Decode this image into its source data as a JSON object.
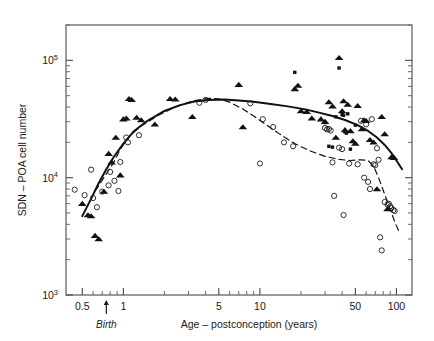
{
  "figure": {
    "name": "sdn-poa-cell-number-vs-age-scatter"
  },
  "chart_data": {
    "type": "scatter",
    "title": "",
    "xlabel": "Age – postconception (years)",
    "ylabel": "SDN – POA cell number",
    "xscale": "log",
    "yscale": "log",
    "xlim": [
      0.38,
      130
    ],
    "ylim": [
      1000,
      200000
    ],
    "grid": false,
    "legend": "none",
    "x_ticks": [
      {
        "value": 0.5,
        "label": "0.5"
      },
      {
        "value": 1,
        "label": "1"
      },
      {
        "value": 5,
        "label": "5"
      },
      {
        "value": 10,
        "label": "10"
      },
      {
        "value": 50,
        "label": "50"
      },
      {
        "value": 100,
        "label": "100"
      }
    ],
    "x_minor_ticks": [
      0.6,
      0.7,
      0.8,
      0.9,
      2,
      3,
      4,
      6,
      7,
      8,
      9,
      20,
      30,
      40,
      60,
      70,
      80,
      90
    ],
    "y_ticks": [
      {
        "value": 100000,
        "base": "10",
        "exp": "5"
      },
      {
        "value": 10000,
        "base": "10",
        "exp": "4"
      },
      {
        "value": 1000,
        "base": "10",
        "exp": "3"
      }
    ],
    "y_minor_ticks": [
      2000,
      3000,
      4000,
      5000,
      6000,
      7000,
      8000,
      9000,
      20000,
      30000,
      40000,
      50000,
      60000,
      70000,
      80000,
      90000,
      200000
    ],
    "annotations": [
      {
        "name": "birth-marker",
        "text": "Birth",
        "x": 0.75,
        "style": "italic",
        "arrow": "up"
      }
    ],
    "series": [
      {
        "name": "open-circles",
        "marker": "open-circle",
        "color": "#1a1a1a",
        "points": [
          [
            0.44,
            7900
          ],
          [
            0.52,
            7100
          ],
          [
            0.58,
            11700
          ],
          [
            0.6,
            6700
          ],
          [
            0.64,
            5600
          ],
          [
            0.7,
            7600
          ],
          [
            0.78,
            8600
          ],
          [
            0.8,
            11200
          ],
          [
            0.86,
            9400
          ],
          [
            0.92,
            7700
          ],
          [
            0.95,
            13600
          ],
          [
            1.05,
            22000
          ],
          [
            1.08,
            20000
          ],
          [
            1.3,
            23000
          ],
          [
            3.6,
            43500
          ],
          [
            4.0,
            46000
          ],
          [
            8.5,
            43000
          ],
          [
            10.5,
            31500
          ],
          [
            10.0,
            13200
          ],
          [
            12.5,
            27000
          ],
          [
            15.0,
            20000
          ],
          [
            17.5,
            18500
          ],
          [
            30.0,
            26500
          ],
          [
            31.0,
            25800
          ],
          [
            32.0,
            26000
          ],
          [
            33.0,
            25200
          ],
          [
            34.0,
            13500
          ],
          [
            35.0,
            7000
          ],
          [
            38.0,
            18000
          ],
          [
            40.0,
            17500
          ],
          [
            41.0,
            4800
          ],
          [
            45.0,
            13200
          ],
          [
            52.0,
            13000
          ],
          [
            55.0,
            30500
          ],
          [
            58.0,
            10000
          ],
          [
            60.0,
            28500
          ],
          [
            62.0,
            9200
          ],
          [
            64.0,
            8000
          ],
          [
            66.0,
            31500
          ],
          [
            68.0,
            13000
          ],
          [
            70.0,
            12800
          ],
          [
            72.0,
            17800
          ],
          [
            74.0,
            14200
          ],
          [
            76.0,
            3100
          ],
          [
            78.0,
            2400
          ],
          [
            82.0,
            6200
          ],
          [
            86.0,
            5900
          ],
          [
            88.0,
            6000
          ],
          [
            90.0,
            5700
          ],
          [
            92.0,
            5500
          ],
          [
            95.0,
            5300
          ],
          [
            97.0,
            5200
          ]
        ]
      },
      {
        "name": "filled-triangles",
        "marker": "filled-triangle",
        "color": "#111111",
        "points": [
          [
            0.5,
            6000
          ],
          [
            0.55,
            4800
          ],
          [
            0.58,
            4700
          ],
          [
            0.62,
            3200
          ],
          [
            0.66,
            3000
          ],
          [
            0.72,
            7600
          ],
          [
            0.78,
            16000
          ],
          [
            0.82,
            13500
          ],
          [
            0.88,
            22000
          ],
          [
            0.95,
            10500
          ],
          [
            1.0,
            31500
          ],
          [
            1.05,
            32000
          ],
          [
            1.1,
            47000
          ],
          [
            1.15,
            46000
          ],
          [
            1.25,
            32500
          ],
          [
            1.35,
            31000
          ],
          [
            1.7,
            28500
          ],
          [
            2.2,
            47000
          ],
          [
            2.4,
            46500
          ],
          [
            3.2,
            33000
          ],
          [
            7.0,
            62000
          ],
          [
            7.5,
            27000
          ],
          [
            18.0,
            57000
          ],
          [
            19.0,
            61000
          ],
          [
            20.0,
            37000
          ],
          [
            22.0,
            36500
          ],
          [
            24.0,
            32000
          ],
          [
            28.0,
            31500
          ],
          [
            30.0,
            30000
          ],
          [
            32.0,
            44000
          ],
          [
            34.0,
            40500
          ],
          [
            36.0,
            22000
          ],
          [
            38.0,
            105000
          ],
          [
            40.0,
            37000
          ],
          [
            41.0,
            45000
          ],
          [
            42.0,
            25500
          ],
          [
            44.0,
            42000
          ],
          [
            46.0,
            25000
          ],
          [
            48.0,
            20500
          ],
          [
            50.0,
            19500
          ],
          [
            52.0,
            41000
          ],
          [
            56.0,
            26000
          ],
          [
            58.0,
            31000
          ],
          [
            60.0,
            30500
          ],
          [
            64.0,
            21000
          ],
          [
            68.0,
            20000
          ],
          [
            72.0,
            8000
          ],
          [
            78.0,
            33000
          ],
          [
            82.0,
            23500
          ],
          [
            86.0,
            5400
          ],
          [
            92.0,
            15000
          ],
          [
            96.0,
            14800
          ]
        ]
      },
      {
        "name": "filled-squares",
        "marker": "filled-square",
        "color": "#111111",
        "points": [
          [
            18.0,
            79000
          ],
          [
            30.0,
            29500
          ],
          [
            32.0,
            18500
          ],
          [
            34.0,
            18200
          ],
          [
            36.0,
            33000
          ],
          [
            38.0,
            86000
          ],
          [
            40.0,
            34500
          ],
          [
            41.0,
            34000
          ],
          [
            42.0,
            24500
          ],
          [
            43.0,
            24000
          ],
          [
            44.0,
            35000
          ],
          [
            46.0,
            17500
          ],
          [
            50.0,
            28000
          ]
        ]
      }
    ],
    "curves": [
      {
        "name": "solid-fit-curve",
        "style": "solid",
        "color": "#111111",
        "points": [
          [
            0.5,
            4700
          ],
          [
            0.58,
            6600
          ],
          [
            0.66,
            9000
          ],
          [
            0.75,
            11800
          ],
          [
            0.85,
            15000
          ],
          [
            1.0,
            19500
          ],
          [
            1.2,
            25000
          ],
          [
            1.5,
            30500
          ],
          [
            2.0,
            37000
          ],
          [
            2.6,
            41500
          ],
          [
            3.3,
            44500
          ],
          [
            4.2,
            46000
          ],
          [
            5.5,
            46300
          ],
          [
            7.0,
            45500
          ],
          [
            9.0,
            44300
          ],
          [
            12.0,
            42500
          ],
          [
            16.0,
            40500
          ],
          [
            22.0,
            38000
          ],
          [
            28.0,
            35500
          ],
          [
            34.0,
            33500
          ],
          [
            42.0,
            31000
          ],
          [
            52.0,
            28000
          ],
          [
            62.0,
            25000
          ],
          [
            72.0,
            22000
          ],
          [
            82.0,
            19000
          ],
          [
            92.0,
            16200
          ],
          [
            100.0,
            14000
          ],
          [
            110.0,
            11800
          ]
        ]
      },
      {
        "name": "dashed-fit-curve",
        "style": "dashed",
        "color": "#111111",
        "points": [
          [
            0.62,
            7700
          ],
          [
            0.68,
            9000
          ],
          [
            0.75,
            10800
          ],
          [
            0.85,
            13500
          ],
          [
            0.95,
            17500
          ],
          [
            1.1,
            22500
          ],
          [
            1.35,
            27500
          ],
          [
            1.8,
            34000
          ],
          [
            2.4,
            40000
          ],
          [
            3.2,
            45000
          ],
          [
            4.2,
            47500
          ],
          [
            5.0,
            47000
          ],
          [
            6.0,
            44000
          ],
          [
            7.5,
            38500
          ],
          [
            9.0,
            33500
          ],
          [
            11.0,
            28500
          ],
          [
            14.0,
            23500
          ],
          [
            18.0,
            19500
          ],
          [
            23.0,
            17000
          ],
          [
            30.0,
            15200
          ],
          [
            38.0,
            14300
          ],
          [
            46.0,
            14000
          ],
          [
            55.0,
            14200
          ],
          [
            62.0,
            14000
          ],
          [
            68.0,
            12500
          ],
          [
            74.0,
            10000
          ],
          [
            80.0,
            7800
          ],
          [
            86.0,
            6200
          ],
          [
            92.0,
            5000
          ],
          [
            98.0,
            4100
          ],
          [
            104.0,
            3500
          ]
        ]
      }
    ]
  }
}
